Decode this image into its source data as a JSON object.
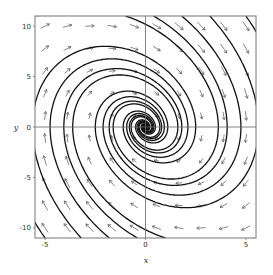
{
  "chart_data": {
    "type": "vector_field_streamplot",
    "title": "",
    "xlabel": "x",
    "ylabel": "y",
    "xlim": [
      -5.5,
      5.5
    ],
    "ylim": [
      -11,
      11
    ],
    "xticks": [
      -5,
      0,
      5
    ],
    "xtick_labels": [
      "-5",
      "0",
      "5"
    ],
    "yticks": [
      -10,
      -5,
      0,
      5,
      10
    ],
    "ytick_labels": [
      "-10",
      "-5",
      "0",
      "5",
      "10"
    ],
    "grid": false,
    "zero_lines": true,
    "system": {
      "dx": "y",
      "dy": "-4*x - y",
      "equilibrium": [
        0,
        0
      ],
      "kind": "stable spiral (clockwise)"
    },
    "arrow_grid": {
      "x_count": 10,
      "y_count": 10
    },
    "streamline_seeds": [
      [
        -5.0,
        -11
      ],
      [
        -3.2,
        -11
      ],
      [
        -1.8,
        -11
      ],
      [
        -0.4,
        -11
      ],
      [
        1.0,
        -11
      ],
      [
        5.0,
        11
      ],
      [
        3.2,
        11
      ],
      [
        1.8,
        11
      ],
      [
        0.4,
        11
      ],
      [
        -1.0,
        11
      ],
      [
        5.4,
        -11
      ],
      [
        -5.4,
        11
      ]
    ],
    "colors": {
      "stream": "#111111",
      "arrow": "#555555",
      "frame": "#777777",
      "zero": "#666666"
    }
  }
}
